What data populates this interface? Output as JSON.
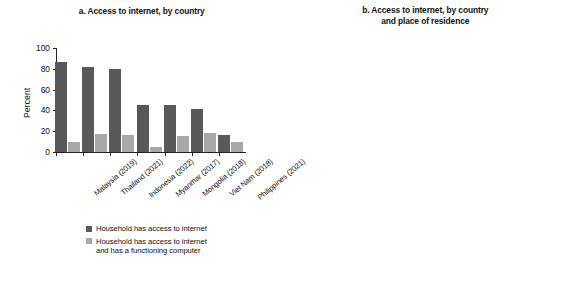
{
  "chart_data": [
    {
      "type": "bar",
      "panel_id": "a",
      "title": "a. Access to internet, by country",
      "xlabel": "",
      "ylabel": "Percent",
      "ylim": [
        0,
        100
      ],
      "yticks": [
        0,
        20,
        40,
        60,
        80,
        100
      ],
      "grid": false,
      "legend_position": "bottom",
      "categories": [
        "Malaysia (2019)",
        "Thailand (2021)",
        "Indonesia (2022)",
        "Myanmar (2017)",
        "Mongolia (2018)",
        "Viet Nam (2018)",
        "Philippines (2021)"
      ],
      "series": [
        {
          "name": "Household has access to internet",
          "color": "#595959",
          "values": [
            87,
            82,
            80,
            45,
            45,
            41,
            16
          ]
        },
        {
          "name": "Household has access to internet and has a functioning computer",
          "color": "#a8a8a8",
          "values": [
            10,
            17,
            16,
            5,
            15,
            18,
            10
          ]
        }
      ]
    },
    {
      "type": "bar",
      "panel_id": "b",
      "title": "b. Access to internet, by country and place of residence",
      "title_lines": [
        "b. Access to internet, by country",
        "and place of residence"
      ],
      "xlabel": "",
      "ylabel": "Percent",
      "ylim": [
        0,
        100
      ],
      "yticks": [
        0,
        20,
        40,
        60,
        80,
        100
      ],
      "grid": false,
      "legend_position": "bottom",
      "categories": [
        "Malaysia",
        "Thailand",
        "Indonesia",
        "Myanmar",
        "Mongolia",
        "Viet Nam",
        "Philippines"
      ],
      "series": [
        {
          "name": "Rural",
          "color": "#595959",
          "values": [
            78,
            79,
            72,
            59,
            30,
            32,
            10
          ]
        },
        {
          "name": "Urban",
          "color": "#a8a8a8",
          "values": [
            92,
            84,
            89,
            78,
            56,
            62,
            23
          ]
        }
      ]
    }
  ],
  "panel_a": {
    "title": "a. Access to internet, by country",
    "ylabel": "Percent",
    "yticks": [
      "100",
      "80",
      "60",
      "40",
      "20",
      "0"
    ],
    "xlabels": [
      "Malaysia (2019)",
      "Thailand (2021)",
      "Indonesia (2022)",
      "Myanmar (2017)",
      "Mongolia (2018)",
      "Viet Nam (2018)",
      "Philippines (2021)"
    ],
    "legend": [
      "Household has access to internet",
      "Household has access to internet",
      "and has a functioning computer"
    ]
  },
  "panel_b": {
    "title_line1": "b. Access to internet, by country",
    "title_line2": "and place of residence",
    "ylabel": "Percent",
    "yticks": [
      "100",
      "80",
      "60",
      "40",
      "20",
      "0"
    ],
    "xlabels": [
      "Malaysia",
      "Thailand",
      "Indonesia",
      "Myanmar",
      "Mongolia",
      "Viet Nam",
      "Philippines"
    ],
    "legend": [
      "Rural",
      "Urban"
    ]
  }
}
